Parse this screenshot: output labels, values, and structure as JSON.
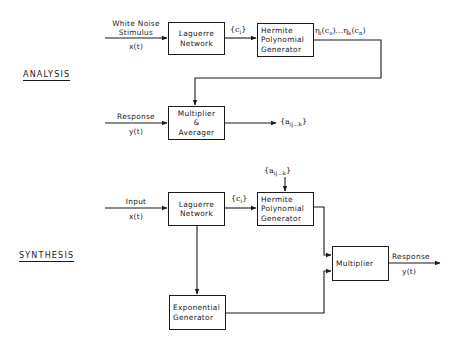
{
  "analysis": {
    "section_label": "ANALYSIS",
    "input_label_line1": "White Noise",
    "input_label_line2": "Stimulus",
    "input_signal": "x(t)",
    "laguerre_line1": "Laguerre",
    "laguerre_line2": "Network",
    "coeff_label": "{c",
    "coeff_sub": "i",
    "coeff_close": "}",
    "hermite_line1": "Hermite",
    "hermite_line2": "Polynomial",
    "hermite_line3": "Generator",
    "hermite_output_eta1": "η",
    "hermite_output_sub1": "i",
    "hermite_output_mid": "(c",
    "hermite_output_sub2": "o",
    "hermite_output_mid2": ")...η",
    "hermite_output_sub3": "k",
    "hermite_output_mid3": "(c",
    "hermite_output_sub4": "n",
    "hermite_output_end": ")",
    "response_label": "Response",
    "response_signal": "y(t)",
    "multiplier_line1": "Multiplier",
    "multiplier_line2": "&",
    "multiplier_line3": "Averager",
    "output_open": "{a",
    "output_sub": "ij...k",
    "output_close": "}"
  },
  "synthesis": {
    "section_label": "SYNTHESIS",
    "kernel_open": "{a",
    "kernel_sub": "ij...k",
    "kernel_close": "}",
    "input_label": "Input",
    "input_signal": "x(t)",
    "laguerre_line1": "Laguerre",
    "laguerre_line2": "Network",
    "coeff_label": "{c",
    "coeff_sub": "i",
    "coeff_close": "}",
    "hermite_line1": "Hermite",
    "hermite_line2": "Polynomial",
    "hermite_line3": "Generator",
    "multiplier_label": "Multiplier",
    "response_label": "Response",
    "response_signal": "y(t)",
    "exponential_line1": "Exponential",
    "exponential_line2": "Generator"
  },
  "colors": {
    "ink": "#1a1a1a",
    "background": "#ffffff"
  }
}
